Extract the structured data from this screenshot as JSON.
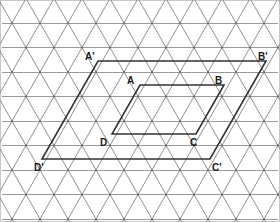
{
  "figure": {
    "width": 280,
    "height": 222,
    "background_color": "#ffffff",
    "border_color": "#c8c8c8"
  },
  "lattice": {
    "type": "triangular",
    "line_color_horizontal": "#9a9a9a",
    "line_color_diagonal": "#8f8f8f",
    "line_width": 1,
    "horizontal_spacing_px": 28,
    "row_spacing_px": 24.5,
    "row_y_values": [
      23,
      47.5,
      72,
      96.5,
      121,
      145.5,
      170,
      194.5,
      219
    ],
    "origin_x": 12,
    "row_offset_px": 14
  },
  "shapes": {
    "inner_parallelogram": {
      "name": "ABCD",
      "stroke_color": "#333333",
      "stroke_width": 1.6,
      "vertices": [
        {
          "label": "A",
          "x": 140,
          "y": 85
        },
        {
          "label": "B",
          "x": 224,
          "y": 85
        },
        {
          "label": "C",
          "x": 196,
          "y": 134
        },
        {
          "label": "D",
          "x": 112,
          "y": 134
        }
      ]
    },
    "outer_parallelogram": {
      "name": "A'B'C'D'",
      "stroke_color": "#333333",
      "stroke_width": 1.6,
      "vertices": [
        {
          "label": "A'",
          "x": 98,
          "y": 61
        },
        {
          "label": "B'",
          "x": 266,
          "y": 61
        },
        {
          "label": "C'",
          "x": 210,
          "y": 159
        },
        {
          "label": "D'",
          "x": 42,
          "y": 159
        }
      ]
    }
  },
  "labels": [
    {
      "id": "label-a-prime",
      "text": "A'",
      "x": 85,
      "y": 52
    },
    {
      "id": "label-b-prime",
      "text": "B'",
      "x": 258,
      "y": 52
    },
    {
      "id": "label-a",
      "text": "A",
      "x": 127,
      "y": 76
    },
    {
      "id": "label-b",
      "text": "B",
      "x": 215,
      "y": 76
    },
    {
      "id": "label-d",
      "text": "D",
      "x": 100,
      "y": 138
    },
    {
      "id": "label-c",
      "text": "C",
      "x": 190,
      "y": 138
    },
    {
      "id": "label-d-prime",
      "text": "D'",
      "x": 34,
      "y": 163
    },
    {
      "id": "label-c-prime",
      "text": "C'",
      "x": 212,
      "y": 163
    }
  ]
}
